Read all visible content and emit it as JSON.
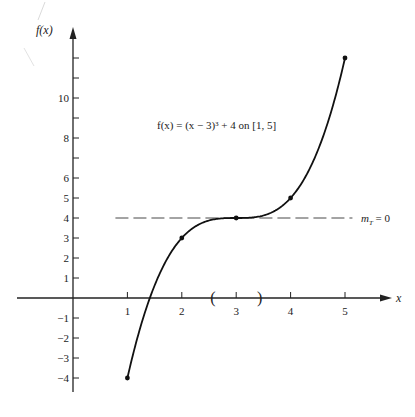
{
  "chart_data": {
    "type": "line",
    "title": "",
    "annotation": "f(x) = (x − 3)³ + 4 on [1, 5]",
    "xlabel": "x",
    "ylabel": "f(x)",
    "function": "(x - 3)^3 + 4",
    "domain": [
      1,
      5
    ],
    "xlim": [
      -1.0,
      5.9
    ],
    "ylim": [
      -5.5,
      13.5
    ],
    "grid": false,
    "legend": null,
    "x_ticks": [
      1,
      2,
      3,
      4,
      5
    ],
    "x_tick_labels": [
      "1",
      "2",
      "3",
      "4",
      "5"
    ],
    "y_ticks": [
      -4,
      -3,
      -2,
      -1,
      1,
      2,
      3,
      4,
      5,
      6,
      7,
      8,
      9,
      10,
      11,
      12
    ],
    "y_tick_labels": [
      "−4",
      "−3",
      "−2",
      "−1",
      "1",
      "2",
      "3",
      "4",
      "5",
      "6",
      "",
      "8",
      "",
      "10",
      "",
      ""
    ],
    "series": [
      {
        "name": "f(x)",
        "x": [
          1,
          2,
          3,
          4,
          5
        ],
        "y": [
          -4,
          3,
          4,
          5,
          12
        ],
        "marked_points": true
      }
    ],
    "tangent_line": {
      "y": 4,
      "x_range": [
        0.78,
        5.1
      ],
      "style": "dashed",
      "label": "m_T = 0",
      "label_main": "m",
      "label_sub": "T",
      "label_rest": " = 0"
    },
    "interval_marks": {
      "left_paren": "(",
      "right_paren": ")",
      "x_left": 2.58,
      "x_right": 3.42
    }
  }
}
